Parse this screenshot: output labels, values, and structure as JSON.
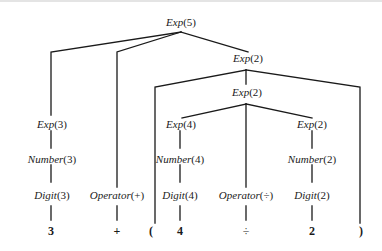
{
  "diagram": {
    "type": "parse-tree",
    "nodes": {
      "root": {
        "name": "Exp",
        "value": "(5)"
      },
      "exp_r": {
        "name": "Exp",
        "value": "(2)"
      },
      "exp_inner": {
        "name": "Exp",
        "value": "(2)"
      },
      "exp3": {
        "name": "Exp",
        "value": "(3)"
      },
      "num3": {
        "name": "Number",
        "value": "(3)"
      },
      "dig3": {
        "name": "Digit",
        "value": "(3)"
      },
      "op_plus": {
        "name": "Operator",
        "value": "(+)"
      },
      "exp4": {
        "name": "Exp",
        "value": "(4)"
      },
      "num4": {
        "name": "Number",
        "value": "(4)"
      },
      "dig4": {
        "name": "Digit",
        "value": "(4)"
      },
      "op_div": {
        "name": "Operator",
        "value": "(÷)"
      },
      "exp2": {
        "name": "Exp",
        "value": "(2)"
      },
      "num2": {
        "name": "Number",
        "value": "(2)"
      },
      "dig2": {
        "name": "Digit",
        "value": "(2)"
      }
    },
    "leaves": {
      "three": "3",
      "plus": "+",
      "lparen": "(",
      "four": "4",
      "div": "÷",
      "two": "2",
      "rparen": ")"
    }
  }
}
